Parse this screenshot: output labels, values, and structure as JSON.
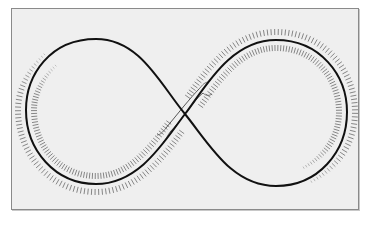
{
  "figure": {
    "colors": {
      "background": "#ffffff",
      "panel": "#efefef",
      "panel_border": "#8a8a8a",
      "curve": "#111111",
      "hatch": "#6a6a6a"
    },
    "panel": {
      "x": 11,
      "y": 8,
      "width": 348,
      "height": 202
    },
    "curve": {
      "left_loop": {
        "top": [
          96,
          39
        ],
        "left": [
          26,
          110
        ],
        "bottom": [
          96,
          184
        ]
      },
      "crossing": [
        185,
        114
      ],
      "right_loop": {
        "top": [
          276,
          40
        ],
        "right": [
          347,
          112
        ],
        "bottom": [
          276,
          186
        ]
      }
    },
    "hatch_band": {
      "start": [
        50,
        62
      ],
      "end": [
        305,
        172
      ],
      "tick_length": 6,
      "tick_spacing": 3.2,
      "offset_from_curve": 8
    }
  }
}
